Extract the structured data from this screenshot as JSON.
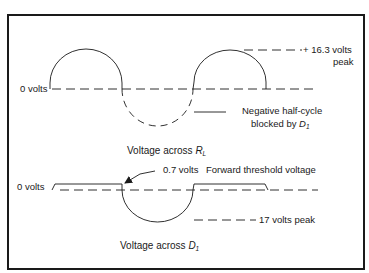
{
  "figure": {
    "top_panel": {
      "zero_label": "0 volts",
      "peak_label_line1": "+ 16.3 volts",
      "peak_label_line2": "peak",
      "annotation_line1": "Negative half-cycle",
      "annotation_line2_prefix": "blocked by ",
      "annotation_symbol": "D",
      "annotation_subscript": "1",
      "caption_prefix": "Voltage across ",
      "caption_symbol": "R",
      "caption_subscript": "L"
    },
    "bottom_panel": {
      "zero_label": "0 volts",
      "threshold_value": "0.7 volts",
      "threshold_label": "Forward threshold voltage",
      "peak_label": "17 volts peak",
      "caption_prefix": "Voltage across ",
      "caption_symbol": "D",
      "caption_subscript": "1"
    },
    "colors": {
      "stroke": "#1a1a1a",
      "background": "#ffffff"
    }
  }
}
